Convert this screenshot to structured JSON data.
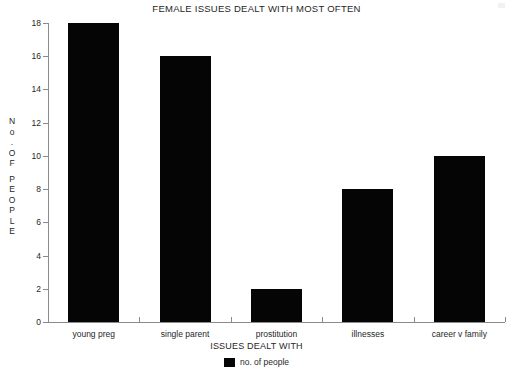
{
  "chart_data": {
    "type": "bar",
    "title": "FEMALE ISSUES DEALT WITH MOST OFTEN",
    "xlabel": "ISSUES DEALT WITH",
    "ylabel": "No. OF PEOPLE",
    "categories": [
      "young preg",
      "single parent",
      "prostitution",
      "illnesses",
      "career v family"
    ],
    "values": [
      18,
      16,
      2,
      8,
      10
    ],
    "series": [
      {
        "name": "no. of people",
        "values": [
          18,
          16,
          2,
          8,
          10
        ],
        "color": "#050505"
      }
    ],
    "ylim": [
      0,
      18
    ],
    "ytick_labels": [
      "0",
      "2",
      "4",
      "6",
      "8",
      "10",
      "12",
      "14",
      "16",
      "18"
    ],
    "ytick_values": [
      0,
      2,
      4,
      6,
      8,
      10,
      12,
      14,
      16,
      18
    ],
    "ytick_step": 2,
    "grid": false,
    "legend": {
      "position": "bottom",
      "entries": [
        {
          "label": "no. of people",
          "color": "#050505"
        }
      ]
    },
    "axis_color": "#8b8b8b",
    "background": "#ffffff"
  },
  "yaxis_title_chars": [
    "N",
    "o",
    ".",
    "O",
    "F",
    "",
    "P",
    "E",
    "O",
    "P",
    "L",
    "E"
  ]
}
